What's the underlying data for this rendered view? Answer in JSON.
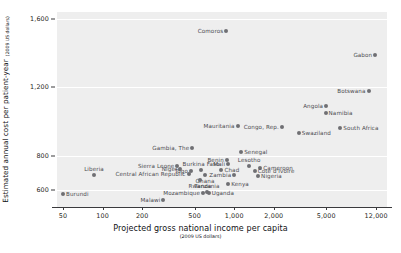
{
  "chart_data": {
    "type": "scatter",
    "title": "",
    "xlabel": "Projected gross national income per capita",
    "xlabel_sub": "(2009 US dollars)",
    "ylabel": "Estimated annual cost per patient-year",
    "ylabel_sub": "(2009 US dollars)",
    "xscale": "log",
    "xlim": [
      45,
      14500
    ],
    "ylim": [
      500,
      1640
    ],
    "xticks": [
      "50",
      "100",
      "200",
      "500",
      "1,000",
      "2,000",
      "5,000",
      "12,000"
    ],
    "xtick_values": [
      50,
      100,
      200,
      500,
      1000,
      2000,
      5000,
      12000
    ],
    "yticks": [
      "1,600",
      "1,200",
      "800",
      "600"
    ],
    "ytick_values": [
      1600,
      1200,
      800,
      600
    ],
    "grid": "horizontal-white",
    "legend": "none",
    "colors": {
      "plot_background": "#eeeeee",
      "gridline": "#ffffff",
      "marker": "#6f6f73",
      "label_text": "#4a4a4f",
      "axis_text": "#1f1f22",
      "axis_line": "#3a3a3d",
      "page_background": "#ffffff"
    },
    "points": [
      {
        "name": "Comoros",
        "x": 870,
        "y": 1530,
        "label_pos": "left"
      },
      {
        "name": "Gabon",
        "x": 11800,
        "y": 1390,
        "label_pos": "left"
      },
      {
        "name": "Botswana",
        "x": 10500,
        "y": 1180,
        "label_pos": "left"
      },
      {
        "name": "Angola",
        "x": 5000,
        "y": 1090,
        "label_pos": "left"
      },
      {
        "name": "Namibia",
        "x": 4950,
        "y": 1050,
        "label_pos": "right"
      },
      {
        "name": "Mauritania",
        "x": 1060,
        "y": 975,
        "label_pos": "left"
      },
      {
        "name": "Congo, Rep.",
        "x": 2300,
        "y": 970,
        "label_pos": "left"
      },
      {
        "name": "South Africa",
        "x": 6400,
        "y": 960,
        "label_pos": "right"
      },
      {
        "name": "Swaziland",
        "x": 3100,
        "y": 930,
        "label_pos": "right"
      },
      {
        "name": "Gambia, The",
        "x": 480,
        "y": 845,
        "label_pos": "left"
      },
      {
        "name": "Senegal",
        "x": 1130,
        "y": 820,
        "label_pos": "right"
      },
      {
        "name": "Benin",
        "x": 880,
        "y": 775,
        "label_pos": "left"
      },
      {
        "name": "Mali",
        "x": 900,
        "y": 750,
        "label_pos": "left"
      },
      {
        "name": "Sierra Leone",
        "x": 370,
        "y": 740,
        "label_pos": "left"
      },
      {
        "name": "Lesotho",
        "x": 1300,
        "y": 740,
        "label_pos": "above"
      },
      {
        "name": "Cameroon",
        "x": 1580,
        "y": 730,
        "label_pos": "right"
      },
      {
        "name": "Niger",
        "x": 390,
        "y": 720,
        "label_pos": "left"
      },
      {
        "name": "Burkina Faso",
        "x": 560,
        "y": 715,
        "label_pos": "above"
      },
      {
        "name": "Togo",
        "x": 470,
        "y": 710,
        "label_pos": "left"
      },
      {
        "name": "Chad",
        "x": 800,
        "y": 715,
        "label_pos": "right"
      },
      {
        "name": "Cote d'Ivoire",
        "x": 1430,
        "y": 710,
        "label_pos": "right"
      },
      {
        "name": "Central African Republic",
        "x": 450,
        "y": 695,
        "label_pos": "left"
      },
      {
        "name": "Ghana",
        "x": 600,
        "y": 690,
        "label_pos": "below"
      },
      {
        "name": "Zambia",
        "x": 1000,
        "y": 690,
        "label_pos": "left"
      },
      {
        "name": "Nigeria",
        "x": 1520,
        "y": 680,
        "label_pos": "right"
      },
      {
        "name": "Liberia",
        "x": 86,
        "y": 690,
        "label_pos": "above"
      },
      {
        "name": "Rwanda",
        "x": 550,
        "y": 655,
        "label_pos": "below"
      },
      {
        "name": "Kenya",
        "x": 900,
        "y": 635,
        "label_pos": "right"
      },
      {
        "name": "Tanzania",
        "x": 620,
        "y": 585,
        "label_pos": "above"
      },
      {
        "name": "Mozambique",
        "x": 580,
        "y": 583,
        "label_pos": "left"
      },
      {
        "name": "Uganda",
        "x": 640,
        "y": 583,
        "label_pos": "right"
      },
      {
        "name": "Burundi",
        "x": 50,
        "y": 575,
        "label_pos": "right"
      },
      {
        "name": "Malawi",
        "x": 290,
        "y": 540,
        "label_pos": "left"
      }
    ]
  }
}
